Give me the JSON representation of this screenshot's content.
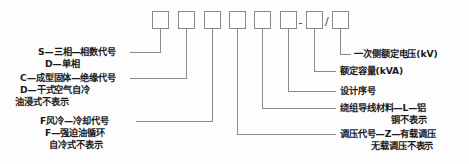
{
  "diagram": {
    "type": "transformer-model-designation-callout",
    "separators": {
      "dash": "-",
      "slash": "/"
    },
    "line_color": "#8a8a8a",
    "text_color": "#1a1a1a",
    "background": "#fdfdfd"
  },
  "boxes": [
    {
      "id": "box-1",
      "value": ""
    },
    {
      "id": "box-2",
      "value": ""
    },
    {
      "id": "box-3",
      "value": ""
    },
    {
      "id": "box-4",
      "value": ""
    },
    {
      "id": "box-5",
      "value": ""
    },
    {
      "id": "box-6",
      "value": ""
    },
    {
      "id": "box-7",
      "value": ""
    },
    {
      "id": "box-8",
      "value": ""
    }
  ],
  "left_labels": [
    {
      "id": "phase-code",
      "lines": [
        "S—三相—相数代号",
        "D—单相"
      ]
    },
    {
      "id": "insulation-code",
      "lines": [
        "C—成型固体—绝缘代号",
        "D—干式空气自冷",
        "油浸式不表示"
      ]
    },
    {
      "id": "cooling-code",
      "lines": [
        "F风冷—冷却代号",
        "F—强迫油循环",
        "自冷式不表示"
      ]
    }
  ],
  "left_label_lines": {
    "phase_1": "S—三相—相数代号",
    "phase_2": "D—单相",
    "insulation_1": "C—成型固体—绝缘代号",
    "insulation_2": "D—干式空气自冷",
    "insulation_3": "油浸式不表示",
    "cooling_1": "F风冷—冷却代号",
    "cooling_2": "F—强迫油循环",
    "cooling_3": "自冷式不表示"
  },
  "right_label_lines": {
    "primary_voltage": "一次侧额定电压(kV)",
    "rated_capacity": "额定容量(kVA)",
    "design_serial": "设计序号",
    "winding_material_1": "绕组导线材料—L—铝",
    "winding_material_2": "铜不表示",
    "tap_changer_1": "调压代号—Z—有载调压",
    "tap_changer_2": "无载调压不表示"
  },
  "right_labels": [
    {
      "id": "primary-voltage",
      "lines": [
        "一次侧额定电压(kV)"
      ]
    },
    {
      "id": "rated-capacity",
      "lines": [
        "额定容量(kVA)"
      ]
    },
    {
      "id": "design-serial",
      "lines": [
        "设计序号"
      ]
    },
    {
      "id": "winding-material",
      "lines": [
        "绕组导线材料—L—铝",
        "铜不表示"
      ]
    },
    {
      "id": "tap-changer",
      "lines": [
        "调压代号—Z—有载调压",
        "无载调压不表示"
      ]
    }
  ]
}
